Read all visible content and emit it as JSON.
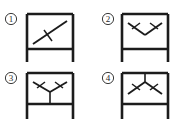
{
  "figure": {
    "background_color": "#ffffff",
    "line_color": "#1c1c1c",
    "label_color": "#2a2a2a",
    "width": 184,
    "height": 125,
    "panel_count": 4
  },
  "panels": [
    {
      "id": "panel-1",
      "label": "①",
      "label_number": "1",
      "brace_type": "single-diagonal",
      "brace_description": "single diagonal brace from lower-left to upper-right with mid-span tick",
      "tick_count": 1,
      "has_vertical_link": false,
      "frame": {
        "left": 27,
        "right": 73,
        "top": 14,
        "beam": 49,
        "base": 62
      },
      "label_pos": {
        "x": 11,
        "y": 19
      },
      "braces": [
        {
          "x1": 33,
          "y1": 44,
          "x2": 67,
          "y2": 21
        }
      ],
      "ticks": [
        {
          "x1": 44,
          "y1": 30,
          "x2": 52,
          "y2": 41
        }
      ],
      "links": []
    },
    {
      "id": "panel-2",
      "label": "②",
      "label_number": "2",
      "brace_type": "chevron-V",
      "brace_description": "V brace descending from top corners to a low apex, ticks on both legs",
      "tick_count": 2,
      "has_vertical_link": false,
      "frame": {
        "left": 122,
        "right": 168,
        "top": 14,
        "beam": 49,
        "base": 62
      },
      "label_pos": {
        "x": 108,
        "y": 19
      },
      "braces": [
        {
          "x1": 128,
          "y1": 23,
          "x2": 145,
          "y2": 35
        },
        {
          "x1": 145,
          "y1": 35,
          "x2": 162,
          "y2": 23
        }
      ],
      "ticks": [
        {
          "x1": 132,
          "y1": 29,
          "x2": 140,
          "y2": 23
        },
        {
          "x1": 150,
          "y1": 23,
          "x2": 158,
          "y2": 29
        }
      ],
      "links": []
    },
    {
      "id": "panel-3",
      "label": "③",
      "label_number": "3",
      "brace_type": "inverted-Y-eccentric",
      "brace_description": "V brace from top corners meeting at center with vertical link down to lower beam",
      "tick_count": 2,
      "has_vertical_link": true,
      "frame": {
        "left": 27,
        "right": 73,
        "top": 73,
        "beam": 104,
        "base": 119
      },
      "label_pos": {
        "x": 11,
        "y": 78
      },
      "braces": [
        {
          "x1": 33,
          "y1": 82,
          "x2": 50,
          "y2": 92
        },
        {
          "x1": 50,
          "y1": 92,
          "x2": 67,
          "y2": 82
        }
      ],
      "ticks": [
        {
          "x1": 37,
          "y1": 88,
          "x2": 45,
          "y2": 82
        },
        {
          "x1": 55,
          "y1": 82,
          "x2": 63,
          "y2": 88
        }
      ],
      "links": [
        {
          "x1": 50,
          "y1": 92,
          "x2": 50,
          "y2": 104
        }
      ]
    },
    {
      "id": "panel-4",
      "label": "④",
      "label_number": "4",
      "brace_type": "Y-eccentric",
      "brace_description": "inverted-V brace rising from lower corners to an apex with vertical link up to top beam",
      "tick_count": 2,
      "has_vertical_link": true,
      "frame": {
        "left": 122,
        "right": 168,
        "top": 73,
        "beam": 104,
        "base": 119
      },
      "label_pos": {
        "x": 108,
        "y": 78
      },
      "braces": [
        {
          "x1": 128,
          "y1": 94,
          "x2": 145,
          "y2": 82
        },
        {
          "x1": 145,
          "y1": 82,
          "x2": 162,
          "y2": 94
        }
      ],
      "ticks": [
        {
          "x1": 132,
          "y1": 84,
          "x2": 140,
          "y2": 90
        },
        {
          "x1": 150,
          "y1": 90,
          "x2": 158,
          "y2": 84
        }
      ],
      "links": [
        {
          "x1": 145,
          "y1": 82,
          "x2": 145,
          "y2": 73
        }
      ]
    }
  ]
}
